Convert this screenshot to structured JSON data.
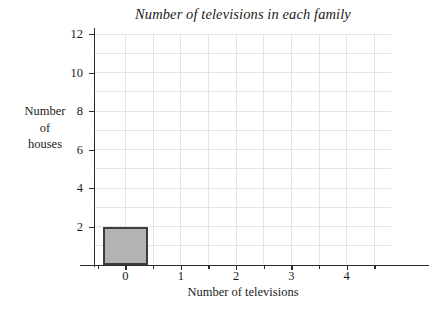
{
  "chart_data": {
    "type": "bar",
    "title": "Number of televisions in each family",
    "xlabel": "Number of televisions",
    "ylabel_lines": [
      "Number",
      "of",
      "houses"
    ],
    "ylabel": "Number of houses",
    "categories": [
      "0",
      "1",
      "2",
      "3",
      "4"
    ],
    "values": [
      2,
      0,
      0,
      0,
      0
    ],
    "x": [
      0,
      1,
      2,
      3,
      4
    ],
    "xlim": [
      -0.55,
      4.8
    ],
    "ylim": [
      0,
      12
    ],
    "xticks": [
      "0",
      "1",
      "2",
      "3",
      "4"
    ],
    "yticks": [
      "2",
      "4",
      "6",
      "8",
      "10",
      "12"
    ],
    "ytick_values": [
      2,
      4,
      6,
      8,
      10,
      12
    ],
    "grid": true,
    "grid_x_step": 0.5,
    "grid_y_step": 1,
    "legend": null,
    "bar_width": 0.8,
    "bar_fill_color": "#b3b3b3",
    "bar_edge_color": "#3d3d3d",
    "grid_color": "#e3e3e8",
    "axis_color": "#2b2b2b",
    "background_color": "#ffffff"
  }
}
